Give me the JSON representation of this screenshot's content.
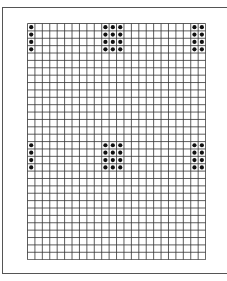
{
  "grid": {
    "columns": 24,
    "rows": 32,
    "cell_width": 7.42,
    "cell_height": 7.38,
    "line_color": "#333333",
    "dot_color": "#111111"
  },
  "dot_blocks": [
    {
      "rows": [
        1,
        2,
        3,
        4
      ],
      "columns": [
        1
      ]
    },
    {
      "rows": [
        1,
        2,
        3,
        4
      ],
      "columns": [
        11,
        12,
        13
      ]
    },
    {
      "rows": [
        1,
        2,
        3,
        4
      ],
      "columns": [
        23,
        24
      ]
    },
    {
      "rows": [
        17,
        18,
        19,
        20
      ],
      "columns": [
        1
      ]
    },
    {
      "rows": [
        17,
        18,
        19,
        20
      ],
      "columns": [
        11,
        12,
        13
      ]
    },
    {
      "rows": [
        17,
        18,
        19,
        20
      ],
      "columns": [
        23,
        24
      ]
    }
  ]
}
